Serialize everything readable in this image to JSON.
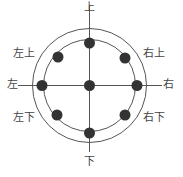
{
  "diagram": {
    "type": "direction-circle",
    "center": {
      "x": 89.5,
      "y": 85.5
    },
    "outer_circle_radius": 57,
    "inner_circle_radius": 46,
    "dot_radius": 5.5,
    "colors": {
      "line": "#555555",
      "dot": "#333333",
      "text": "#444444"
    },
    "axes": {
      "vertical": {
        "x": 89.5,
        "y1": 6,
        "y2": 152
      },
      "horizontal": {
        "y": 85.5,
        "x1": 18,
        "x2": 162
      }
    },
    "dots": [
      {
        "name": "center",
        "x": 89.5,
        "y": 85.5
      },
      {
        "name": "top",
        "x": 89.5,
        "y": 43
      },
      {
        "name": "bottom",
        "x": 89.5,
        "y": 133
      },
      {
        "name": "left",
        "x": 42,
        "y": 85.5
      },
      {
        "name": "right",
        "x": 137,
        "y": 85.5
      },
      {
        "name": "upper-left",
        "x": 58,
        "y": 57
      },
      {
        "name": "upper-right",
        "x": 125,
        "y": 58
      },
      {
        "name": "lower-left",
        "x": 57,
        "y": 115
      },
      {
        "name": "lower-right",
        "x": 125,
        "y": 115
      }
    ],
    "labels": {
      "top": "上",
      "bottom": "下",
      "left": "左",
      "right": "右",
      "upper_left": "左上",
      "upper_right": "右上",
      "lower_left": "左下",
      "lower_right": "右下"
    }
  }
}
